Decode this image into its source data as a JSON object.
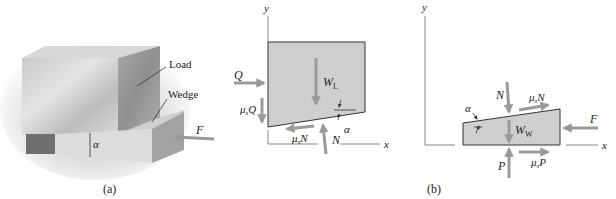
{
  "figure": {
    "panel_a": {
      "caption": "(a)",
      "labels": {
        "load": "Load",
        "wedge": "Wedge",
        "force": "F",
        "angle": "α"
      }
    },
    "panel_b": {
      "caption": "(b)",
      "load_fbd": {
        "axes": {
          "y": "y",
          "x": "x"
        },
        "forces": {
          "Q": "Q",
          "mu_Q": "μ",
          "mu_Q_sub": "s",
          "mu_Q_tail": "Q",
          "W_L": "W",
          "W_L_sub": "L",
          "mu_N": "μ",
          "mu_N_sub": "s",
          "mu_N_tail": "N",
          "N": "N",
          "alpha": "α"
        }
      },
      "wedge_fbd": {
        "axes": {
          "y": "y",
          "x": "x"
        },
        "forces": {
          "N": "N",
          "mu_N": "μ",
          "mu_N_sub": "s",
          "mu_N_tail": "N",
          "alpha": "α",
          "W_W": "W",
          "W_W_sub": "W",
          "F": "F",
          "P": "P",
          "mu_P": "μ",
          "mu_P_sub": "s",
          "mu_P_tail": "P"
        }
      }
    },
    "colors": {
      "arrow": "#9a9a9a",
      "body_fill": "#cfcfcf",
      "line": "#333333",
      "axis": "#888888"
    }
  }
}
